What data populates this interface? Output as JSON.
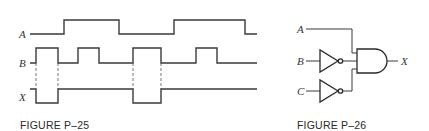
{
  "figure_p25": {
    "caption": "FIGURE P–25",
    "signals": [
      {
        "name": "A",
        "label": "A",
        "levels": "low 30-64, high 64-119, low 119-174, high 174-245, low 245-257"
      },
      {
        "name": "B",
        "label": "B",
        "levels": "low 30-36, high 36-58, low 58-78, high 78-99, low 99-133, high 133-161, low 161-196, high 196-217, low 217-257"
      },
      {
        "name": "X",
        "label": "X",
        "levels": "high 30-36, low 36-58, high 58-133, low 133-161, high 161-257"
      }
    ]
  },
  "figure_p26": {
    "caption": "FIGURE P–26",
    "inputs": [
      "A",
      "B",
      "C"
    ],
    "output": "X",
    "gates": [
      "inverter on B",
      "inverter on C",
      "3-input AND gate"
    ]
  }
}
